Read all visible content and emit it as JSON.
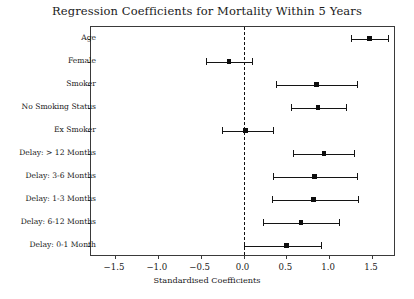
{
  "chart_data": {
    "type": "scatter",
    "subtype": "forest-plot",
    "title": "Regression Coefficients for Mortality Within 5 Years",
    "xlabel": "Standardised Coefficients",
    "ylabel": "",
    "xlim": [
      -1.78,
      1.78
    ],
    "xticks": [
      -1.5,
      -1.0,
      -0.5,
      0.0,
      0.5,
      1.0,
      1.5
    ],
    "xticklabels": [
      "−1.5",
      "−1.0",
      "−0.5",
      "0.0",
      "0.5",
      "1.0",
      "1.5"
    ],
    "grid": false,
    "legend": null,
    "reference_line": {
      "value": 0.0,
      "style": "dashed",
      "color": "#111111"
    },
    "categories": [
      "Age",
      "Female",
      "Smoker",
      "No Smoking Status",
      "Ex Smoker",
      "Delay: > 12 Months",
      "Delay: 3-6 Months",
      "Delay: 1-3 Months",
      "Delay: 6-12 Months",
      "Delay: 0-1 Month"
    ],
    "points": [
      {
        "label": "Age",
        "value": 1.47,
        "ci_low": 1.25,
        "ci_high": 1.69
      },
      {
        "label": "Female",
        "value": -0.17,
        "ci_low": -0.44,
        "ci_high": 0.1
      },
      {
        "label": "Smoker",
        "value": 0.85,
        "ci_low": 0.38,
        "ci_high": 1.32
      },
      {
        "label": "No Smoking Status",
        "value": 0.87,
        "ci_low": 0.56,
        "ci_high": 1.2
      },
      {
        "label": "Ex Smoker",
        "value": 0.02,
        "ci_low": -0.25,
        "ci_high": 0.35
      },
      {
        "label": "Delay: > 12 Months",
        "value": 0.94,
        "ci_low": 0.58,
        "ci_high": 1.29
      },
      {
        "label": "Delay: 3-6 Months",
        "value": 0.83,
        "ci_low": 0.34,
        "ci_high": 1.32
      },
      {
        "label": "Delay: 1-3 Months",
        "value": 0.82,
        "ci_low": 0.33,
        "ci_high": 1.34
      },
      {
        "label": "Delay: 6-12 Months",
        "value": 0.67,
        "ci_low": 0.23,
        "ci_high": 1.11
      },
      {
        "label": "Delay: 0-1 Month",
        "value": 0.5,
        "ci_low": 0.0,
        "ci_high": 0.9
      }
    ],
    "colors": {
      "marker": "#0d0d0d",
      "line": "#141414",
      "axis": "#3a3a3a",
      "background": "#ffffff"
    }
  }
}
